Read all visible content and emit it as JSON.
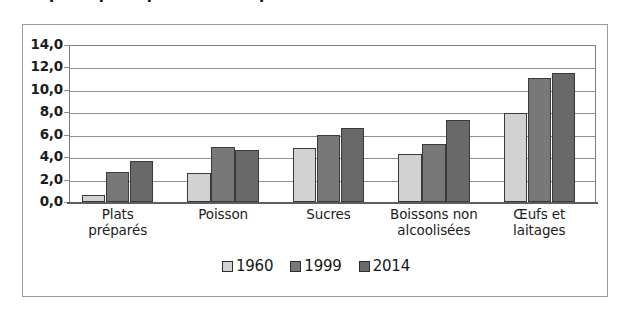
{
  "figure": {
    "cropped_caption_above": "Les principaux postes de dépenses",
    "frame_border_color": "#9b9b9b",
    "background": "#ffffff"
  },
  "chart_data": {
    "type": "bar",
    "title": "",
    "subtitle": "",
    "xlabel": "",
    "ylabel": "",
    "categories": [
      "Plats\npréparés",
      "Poisson",
      "Sucres",
      "Boissons non\nalcoolisées",
      "Œufs et\nlaitages"
    ],
    "category_lines": [
      [
        "Plats",
        "préparés"
      ],
      [
        "Poisson"
      ],
      [
        "Sucres"
      ],
      [
        "Boissons non",
        "alcoolisées"
      ],
      [
        "Œufs et",
        "laitages"
      ]
    ],
    "series": [
      {
        "name": "1960",
        "color": "#d2d2d2",
        "values": [
          0.6,
          2.6,
          4.8,
          4.3,
          7.9
        ]
      },
      {
        "name": "1999",
        "color": "#787878",
        "values": [
          2.7,
          4.9,
          6.0,
          5.2,
          11.1
        ]
      },
      {
        "name": "2014",
        "color": "#696969",
        "values": [
          3.7,
          4.6,
          6.6,
          7.3,
          11.5
        ]
      }
    ],
    "ylim": [
      0,
      14
    ],
    "ytick_step": 2,
    "ytick_labels": [
      "14,0",
      "12,0",
      "10,0",
      "8,0",
      "6,0",
      "4,0",
      "2,0",
      "0,0"
    ],
    "ytick_values": [
      14,
      12,
      10,
      8,
      6,
      4,
      2,
      0
    ],
    "grid": true,
    "grid_axis": "y",
    "grid_color": "#8e8e8e",
    "legend_position": "bottom-center",
    "legend_entries": [
      "1960",
      "1999",
      "2014"
    ],
    "bar_border_color": "#3a3a3a",
    "decimal_separator": ","
  }
}
